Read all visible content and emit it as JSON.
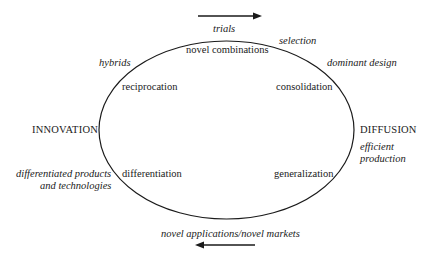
{
  "diagram": {
    "poles": {
      "left": "INNOVATION",
      "right": "DIFFUSION"
    },
    "stages": {
      "top": "novel combinations",
      "upper_left": "reciprocation",
      "upper_right": "consolidation",
      "lower_left": "differentiation",
      "lower_right": "generalization"
    },
    "outcomes": {
      "top_arrow": "trials",
      "selection": "selection",
      "dominant_design": "dominant design",
      "hybrids": "hybrids",
      "efficient_1": "efficient",
      "efficient_2": "production",
      "differentiated_1": "differentiated products",
      "differentiated_2": "and technologies",
      "bottom_arrow": "novel applications/novel markets"
    },
    "arrows": {
      "top": "right",
      "bottom": "left"
    },
    "colors": {
      "line": "#1a1a1a",
      "text": "#1a1a1a"
    }
  }
}
